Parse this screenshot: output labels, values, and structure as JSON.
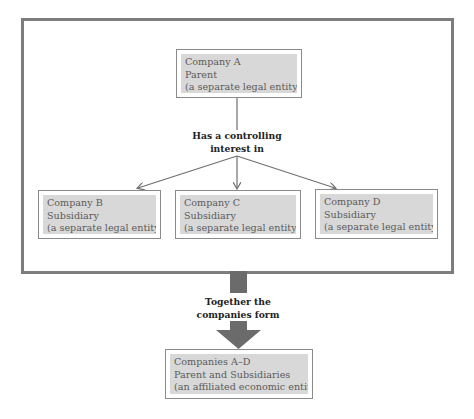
{
  "diagram": {
    "title": "",
    "parent": {
      "name": "Company A",
      "role": "Parent",
      "note": "(a separate legal entity)"
    },
    "relation_label": {
      "line1": "Has a controlling",
      "line2": "interest in"
    },
    "subsidiaries": [
      {
        "name": "Company B",
        "role": "Subsidiary",
        "note": "(a separate legal entity)"
      },
      {
        "name": "Company C",
        "role": "Subsidiary",
        "note": "(a separate legal entity)"
      },
      {
        "name": "Company D",
        "role": "Subsidiary",
        "note": "(a separate legal entity)"
      }
    ],
    "combine_label": {
      "line1": "Together the",
      "line2": "companies form"
    },
    "result": {
      "name": "Companies A–D",
      "role": "Parent and Subsidiaries",
      "note": "(an affiliated economic entity)"
    },
    "colors": {
      "frame": "#7d7d7d",
      "box_border": "#8a8a8a",
      "box_fill": "#d8d8d8",
      "box_text": "#5a5a5a",
      "arrow": "#6f6f6f",
      "big_arrow": "#6b6b6b",
      "label_text": "#222222"
    }
  }
}
